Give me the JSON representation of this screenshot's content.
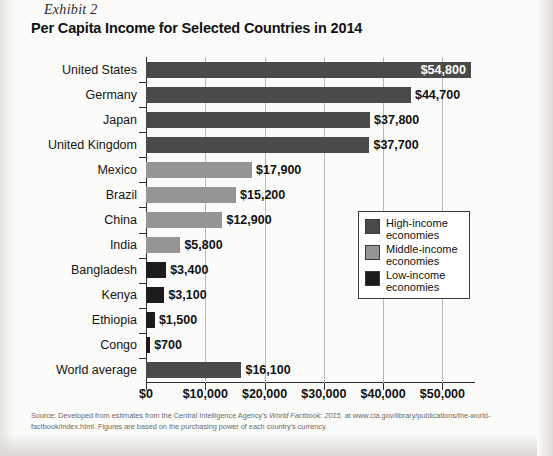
{
  "exhibit": {
    "number": "Exhibit 2",
    "title": "Per Capita Income for Selected Countries in 2014"
  },
  "legend": {
    "items": [
      {
        "label": "High-income economies",
        "color": "#4a4a4a"
      },
      {
        "label": "Middle-income economies",
        "color": "#959595"
      },
      {
        "label": "Low-income economies",
        "color": "#1c1c1c"
      }
    ]
  },
  "source": {
    "line1_a": "Source: Developed from estimates from the Central Intelligence Agency's ",
    "line1_italic": "World Factbook: 2015,",
    "line1_b": " at www.cia.gov/library/publications/the-world-factbook",
    "line2": "/index.html. Figures are based on the purchasing power of each country's currency."
  },
  "chart_data": {
    "type": "bar",
    "orientation": "horizontal",
    "title": "Per Capita Income for Selected Countries in 2014",
    "xlabel": "",
    "ylabel": "",
    "xlim": [
      0,
      55500
    ],
    "grid": "vertical",
    "legend_position": "inside-right",
    "xticks": [
      0,
      10000,
      20000,
      30000,
      40000,
      50000
    ],
    "xtick_labels": [
      "$0",
      "$10,000",
      "$20,000",
      "$30,000",
      "$40,000",
      "$50,000"
    ],
    "categories": [
      "United States",
      "Germany",
      "Japan",
      "United Kingdom",
      "Mexico",
      "Brazil",
      "China",
      "India",
      "Bangladesh",
      "Kenya",
      "Ethiopia",
      "Congo",
      "World average"
    ],
    "values": [
      54800,
      44700,
      37800,
      37700,
      17900,
      15200,
      12900,
      5800,
      3400,
      3100,
      1500,
      700,
      16100
    ],
    "data_labels": [
      "$54,800",
      "$44,700",
      "$37,800",
      "$37,700",
      "$17,900",
      "$15,200",
      "$12,900",
      "$5,800",
      "$3,400",
      "$3,100",
      "$1,500",
      "$700",
      "$16,100"
    ],
    "groups": [
      "high-income",
      "high-income",
      "high-income",
      "high-income",
      "middle-income",
      "middle-income",
      "middle-income",
      "middle-income",
      "low-income",
      "low-income",
      "low-income",
      "low-income",
      "world-average"
    ],
    "group_colors": {
      "high-income": "#4a4a4a",
      "middle-income": "#959595",
      "low-income": "#1c1c1c",
      "world-average": "#4a4a4a"
    },
    "label_placement": [
      "inside",
      "outside",
      "outside",
      "outside",
      "outside",
      "outside",
      "outside",
      "outside",
      "outside",
      "outside",
      "outside",
      "outside",
      "outside"
    ]
  }
}
